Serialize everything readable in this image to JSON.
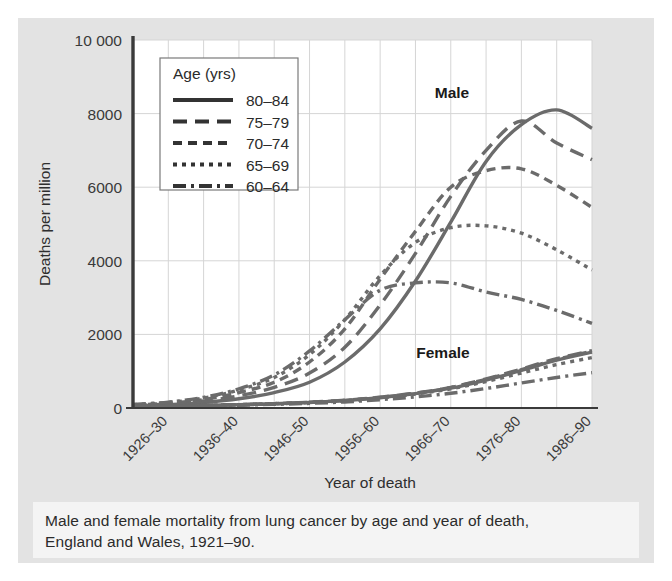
{
  "figure": {
    "caption_line_1": "Male and female mortality from lung cancer by age and year of death,",
    "caption_line_2": "England and Wales, 1921–90."
  },
  "legend": {
    "title": "Age (yrs)",
    "entries": [
      {
        "label": "80–84",
        "style": "solid"
      },
      {
        "label": "75–79",
        "style": "long-dash"
      },
      {
        "label": "70–74",
        "style": "medium-dash"
      },
      {
        "label": "65–69",
        "style": "dotted"
      },
      {
        "label": "60–64",
        "style": "dash-dot"
      }
    ]
  },
  "annotations": {
    "male": "Male",
    "female": "Female"
  },
  "colors": {
    "panel_background": "#e3e3e3",
    "plot_background": "#ffffff",
    "caption_background": "#f4f4f4",
    "line": "#6b6b6b",
    "axis": "#3a3a3a",
    "grid": "#d5d5d5",
    "text": "#2b2b2b"
  },
  "chart_data": {
    "type": "line",
    "title": "",
    "xlabel": "Year of death",
    "ylabel": "Deaths per million",
    "ylim": [
      0,
      10000
    ],
    "yticks": [
      0,
      2000,
      4000,
      6000,
      8000,
      10000
    ],
    "ytick_labels": [
      "0",
      "2000",
      "4000",
      "6000",
      "8000",
      "10 000"
    ],
    "grid": true,
    "legend_position": "upper-left-inside",
    "x": [
      "1921–25",
      "1926–30",
      "1931–35",
      "1936–40",
      "1941–45",
      "1946–50",
      "1951–55",
      "1956–60",
      "1961–65",
      "1966–70",
      "1971–75",
      "1976–80",
      "1981–85",
      "1986–90"
    ],
    "xtick_labels": [
      "",
      "1926–30",
      "",
      "1936–40",
      "",
      "1946–50",
      "",
      "1956–60",
      "",
      "1966–70",
      "",
      "1976–80",
      "",
      "1986–90"
    ],
    "groups": [
      "Male",
      "Female"
    ],
    "series": [
      {
        "name": "Male 80–84",
        "group": "Male",
        "age": "80–84",
        "style": "solid",
        "values": [
          60,
          90,
          150,
          250,
          420,
          700,
          1250,
          2150,
          3450,
          5050,
          6700,
          7700,
          8100,
          7600
        ]
      },
      {
        "name": "Male 75–79",
        "group": "Male",
        "age": "75–79",
        "style": "long-dash",
        "values": [
          70,
          110,
          190,
          330,
          560,
          950,
          1650,
          2800,
          4200,
          5750,
          7000,
          7800,
          7200,
          6750
        ]
      },
      {
        "name": "Male 70–74",
        "group": "Male",
        "age": "70–74",
        "style": "medium-dash",
        "values": [
          80,
          130,
          230,
          420,
          700,
          1250,
          2150,
          3500,
          4800,
          6000,
          6450,
          6500,
          6050,
          5450
        ]
      },
      {
        "name": "Male 65–69",
        "group": "Male",
        "age": "65–69",
        "style": "dotted",
        "values": [
          90,
          150,
          270,
          490,
          830,
          1450,
          2400,
          3600,
          4500,
          4900,
          4950,
          4750,
          4300,
          3750
        ]
      },
      {
        "name": "Male 60–64",
        "group": "Male",
        "age": "60–64",
        "style": "dash-dot",
        "values": [
          95,
          160,
          290,
          520,
          900,
          1550,
          2400,
          3200,
          3400,
          3400,
          3150,
          2950,
          2650,
          2300
        ]
      },
      {
        "name": "Female 80–84",
        "group": "Female",
        "age": "80–84",
        "style": "solid",
        "values": [
          45,
          55,
          70,
          90,
          115,
          150,
          200,
          280,
          390,
          540,
          760,
          1020,
          1300,
          1520
        ]
      },
      {
        "name": "Female 75–79",
        "group": "Female",
        "age": "75–79",
        "style": "long-dash",
        "values": [
          45,
          55,
          70,
          92,
          120,
          158,
          212,
          295,
          405,
          560,
          790,
          1060,
          1340,
          1560
        ]
      },
      {
        "name": "Female 70–74",
        "group": "Female",
        "age": "70–74",
        "style": "medium-dash",
        "values": [
          44,
          54,
          68,
          90,
          118,
          155,
          208,
          290,
          400,
          555,
          780,
          1040,
          1320,
          1540
        ]
      },
      {
        "name": "Female 65–69",
        "group": "Female",
        "age": "65–69",
        "style": "dotted",
        "values": [
          42,
          52,
          66,
          86,
          112,
          148,
          198,
          275,
          380,
          520,
          720,
          950,
          1180,
          1370
        ]
      },
      {
        "name": "Female 60–64",
        "group": "Female",
        "age": "60–64",
        "style": "dash-dot",
        "values": [
          40,
          48,
          60,
          76,
          98,
          126,
          165,
          225,
          300,
          400,
          530,
          680,
          830,
          960
        ]
      }
    ]
  }
}
